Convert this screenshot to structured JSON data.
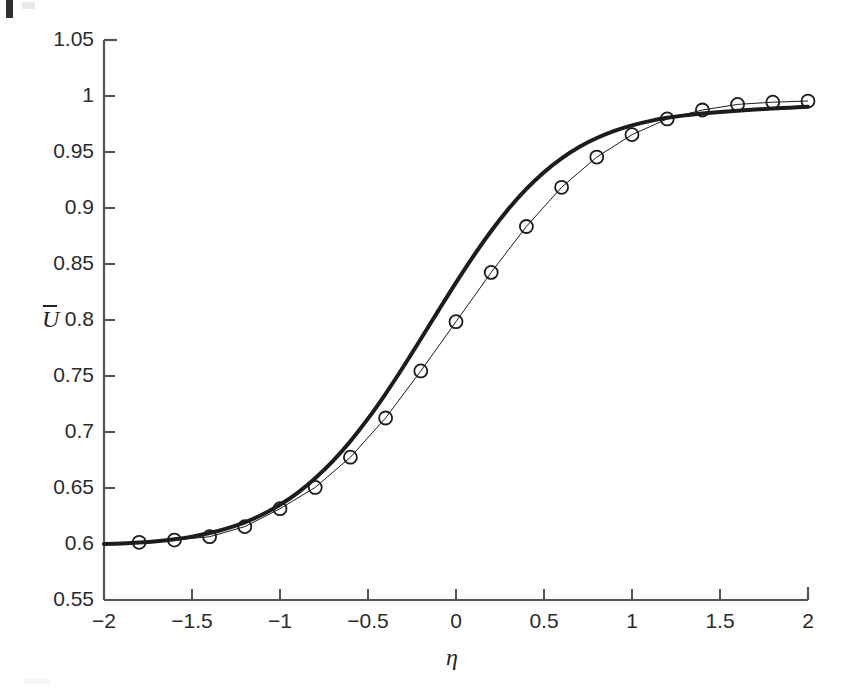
{
  "figure": {
    "background_color": "#ffffff",
    "ink_color": "#1c1c1c"
  },
  "chart_data": {
    "type": "line",
    "title": "",
    "subtitle": "",
    "xlabel": "η",
    "ylabel": "Ū",
    "xlim": [
      -2,
      2
    ],
    "ylim": [
      0.55,
      1.05
    ],
    "grid": false,
    "legend": null,
    "legend_position": "none",
    "xticks": [
      -2,
      -1.5,
      -1,
      -0.5,
      0,
      0.5,
      1,
      1.5,
      2
    ],
    "xtick_labels": [
      "−2",
      "−1.5",
      "−1",
      "−0.5",
      "0",
      "0.5",
      "1",
      "1.5",
      "2"
    ],
    "yticks": [
      0.55,
      0.6,
      0.65,
      0.7,
      0.75,
      0.8,
      0.85,
      0.9,
      0.95,
      1,
      1.05
    ],
    "ytick_labels": [
      "0.55",
      "0.6",
      "0.65",
      "0.7",
      "0.75",
      "0.8",
      "0.85",
      "0.9",
      "0.95",
      "1",
      "1.05"
    ],
    "series": [
      {
        "name": "model curve",
        "style": "solid-thick-line",
        "color": "#1c1c1c",
        "linewidth": 4,
        "marker": "none",
        "x": [
          -2,
          -1.9,
          -1.8,
          -1.7,
          -1.6,
          -1.5,
          -1.4,
          -1.3,
          -1.2,
          -1.1,
          -1,
          -0.9,
          -0.8,
          -0.7,
          -0.6,
          -0.5,
          -0.4,
          -0.3,
          -0.2,
          -0.1,
          0,
          0.1,
          0.2,
          0.3,
          0.4,
          0.5,
          0.6,
          0.7,
          0.8,
          0.9,
          1,
          1.1,
          1.2,
          1.3,
          1.4,
          1.5,
          1.6,
          1.7,
          1.8,
          1.9,
          2
        ],
        "y": [
          0.6,
          0.6005,
          0.6013,
          0.6025,
          0.6042,
          0.6066,
          0.6098,
          0.614,
          0.6194,
          0.6263,
          0.635,
          0.6457,
          0.6587,
          0.674,
          0.6918,
          0.7119,
          0.7341,
          0.758,
          0.783,
          0.8084,
          0.8334,
          0.8573,
          0.8795,
          0.8995,
          0.917,
          0.932,
          0.9444,
          0.9545,
          0.9625,
          0.9689,
          0.9738,
          0.9776,
          0.9805,
          0.9827,
          0.9844,
          0.9858,
          0.9869,
          0.9879,
          0.9888,
          0.9896,
          0.9905
        ]
      },
      {
        "name": "measured data",
        "style": "open-circle-markers",
        "color": "#1c1c1c",
        "linewidth": 1,
        "marker": "circle-open",
        "marker_size": 13,
        "x": [
          -1.8,
          -1.6,
          -1.4,
          -1.2,
          -1,
          -0.8,
          -0.6,
          -0.4,
          -0.2,
          0,
          0.2,
          0.4,
          0.6,
          0.8,
          1,
          1.2,
          1.4,
          1.6,
          1.8,
          2
        ],
        "y": [
          0.6015,
          0.6035,
          0.6065,
          0.6155,
          0.6315,
          0.6505,
          0.6775,
          0.7125,
          0.7545,
          0.7985,
          0.8425,
          0.8835,
          0.9185,
          0.9455,
          0.9655,
          0.9795,
          0.9875,
          0.9925,
          0.9945,
          0.9955
        ]
      }
    ]
  }
}
